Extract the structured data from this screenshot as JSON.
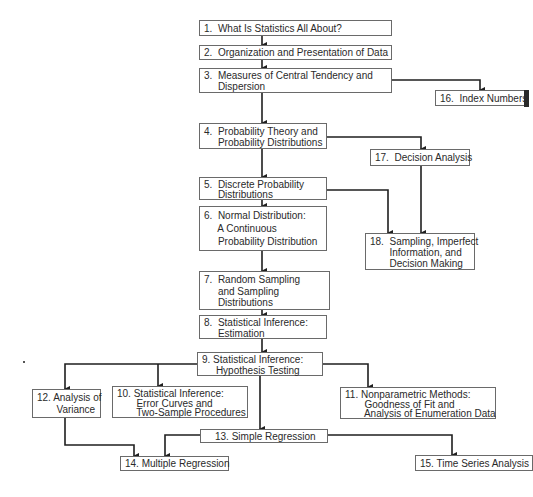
{
  "diagram": {
    "type": "flowchart",
    "nodes": [
      {
        "id": "1",
        "label": "1.  What Is Statistics All About?"
      },
      {
        "id": "2",
        "label": "2.  Organization and Presentation of Data"
      },
      {
        "id": "3",
        "label": "3.  Measures of Central Tendency and\n     Dispersion"
      },
      {
        "id": "4",
        "label": "4.  Probability Theory and\n     Probability Distributions"
      },
      {
        "id": "5",
        "label": "5.  Discrete Probability\n     Distributions"
      },
      {
        "id": "6",
        "label": "6.  Normal Distribution:\n     A Continuous\n     Probability Distribution"
      },
      {
        "id": "7",
        "label": "7.  Random Sampling\n     and Sampling\n     Distributions"
      },
      {
        "id": "8",
        "label": "8.  Statistical Inference:\n     Estimation"
      },
      {
        "id": "9",
        "label": "9. Statistical Inference:\n     Hypothesis Testing"
      },
      {
        "id": "10",
        "label": "10. Statistical Inference:\n       Error Curves and\n       Two-Sample Procedures"
      },
      {
        "id": "11",
        "label": "11. Nonparametric Methods:\n       Goodness of Fit and\n       Analysis of Enumeration Data"
      },
      {
        "id": "12",
        "label": "12. Analysis of\n       Variance"
      },
      {
        "id": "13",
        "label": "13. Simple Regression"
      },
      {
        "id": "14",
        "label": "14. Multiple Regression"
      },
      {
        "id": "15",
        "label": "15. Time Series Analysis"
      },
      {
        "id": "16",
        "label": "16.  Index Numbers"
      },
      {
        "id": "17",
        "label": "17.  Decision Analysis"
      },
      {
        "id": "18",
        "label": "18.  Sampling, Imperfect\n       Information, and\n       Decision Making"
      }
    ],
    "edges": [
      [
        "1",
        "2"
      ],
      [
        "2",
        "3"
      ],
      [
        "3",
        "4"
      ],
      [
        "3",
        "16"
      ],
      [
        "4",
        "5"
      ],
      [
        "4",
        "17"
      ],
      [
        "5",
        "6"
      ],
      [
        "5",
        "18"
      ],
      [
        "17",
        "18"
      ],
      [
        "6",
        "7"
      ],
      [
        "7",
        "8"
      ],
      [
        "8",
        "9"
      ],
      [
        "9",
        "12"
      ],
      [
        "9",
        "10"
      ],
      [
        "9",
        "11"
      ],
      [
        "9",
        "13"
      ],
      [
        "12",
        "14"
      ],
      [
        "13",
        "14"
      ],
      [
        "13",
        "15"
      ]
    ]
  }
}
